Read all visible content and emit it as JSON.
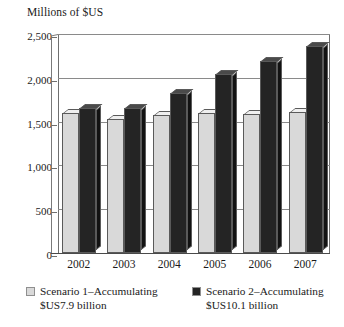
{
  "chart_data": {
    "type": "bar",
    "title": "",
    "ylabel": "Millions of $US",
    "xlabel": "",
    "categories": [
      "2002",
      "2003",
      "2004",
      "2005",
      "2006",
      "2007"
    ],
    "series": [
      {
        "name": "Scenario 1–Accumulating $US7.9 billion",
        "color": "#d9d9d9",
        "values": [
          1600,
          1530,
          1580,
          1600,
          1590,
          1610
        ]
      },
      {
        "name": "Scenario 2–Accumulating $US10.1 billion",
        "color": "#242424",
        "values": [
          1650,
          1660,
          1830,
          2040,
          2190,
          2360
        ]
      }
    ],
    "ylim": [
      0,
      2500
    ],
    "yticks": [
      0,
      500,
      1000,
      1500,
      2000,
      2500
    ],
    "ytick_labels": [
      "0",
      "500",
      "1,000",
      "1,500",
      "2,000",
      "2,500"
    ],
    "grid": true,
    "legend_position": "bottom"
  },
  "legend": [
    {
      "line1": "Scenario 1–Accumulating",
      "line2": "$US7.9 billion",
      "color": "#d9d9d9"
    },
    {
      "line1": "Scenario 2–Accumulating",
      "line2": "$US10.1 billion",
      "color": "#242424"
    }
  ]
}
